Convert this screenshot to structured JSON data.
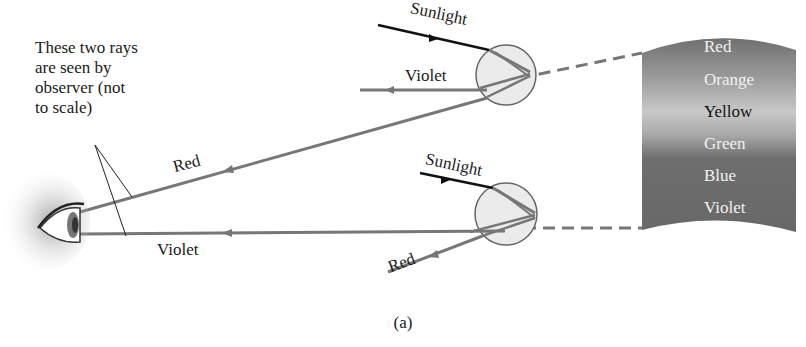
{
  "diagram": {
    "annotation_lines": [
      "These two rays",
      "are seen by",
      "observer (not",
      "to scale)"
    ],
    "top_drop": {
      "incoming_label": "Sunlight",
      "outgoing_label": "Violet"
    },
    "bottom_drop": {
      "incoming_label": "Sunlight",
      "outgoing_label": "Red"
    },
    "observer_rays": {
      "upper_label": "Red",
      "lower_label": "Violet"
    },
    "rainbow_bands": [
      "Red",
      "Orange",
      "Yellow",
      "Green",
      "Blue",
      "Violet"
    ],
    "caption": "(a)",
    "colors": {
      "ray_gray": "#777777",
      "sunlight": "#111111",
      "drop_fill": "#ebebeb",
      "rainbow_dark": "#6a6a6a",
      "rainbow_light": "#c4c4c4"
    }
  }
}
